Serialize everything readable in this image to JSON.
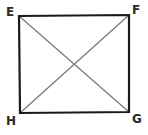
{
  "diagram": {
    "type": "square-with-diagonals",
    "vertices": {
      "E": {
        "label": "E",
        "position": "top-left"
      },
      "F": {
        "label": "F",
        "position": "top-right"
      },
      "G": {
        "label": "G",
        "position": "bottom-right"
      },
      "H": {
        "label": "H",
        "position": "bottom-left"
      }
    },
    "sides": [
      "EF",
      "FG",
      "GH",
      "HE"
    ],
    "diagonals": [
      "EG",
      "FH"
    ],
    "colors": {
      "sides": "#1a1a1a",
      "diagonals": "#7a7a7a",
      "labels": "#2a2a2a"
    }
  }
}
